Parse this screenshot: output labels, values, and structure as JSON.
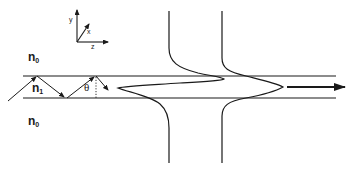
{
  "diagram": {
    "title": "",
    "colors": {
      "line": "#1a1a1a",
      "background": "#ffffff"
    },
    "axes": {
      "y_label": "y",
      "x_label": "x",
      "z_label": "z"
    },
    "regions": {
      "cladding_top": {
        "symbol": "n",
        "subscript": "0"
      },
      "core": {
        "symbol": "n",
        "subscript": "1"
      },
      "cladding_bottom": {
        "symbol": "n",
        "subscript": "0"
      }
    },
    "angle_label": "θ",
    "elements": [
      "waveguide-core-boundaries",
      "zigzag-ray",
      "mode-profile-1",
      "mode-profile-2",
      "propagation-arrow"
    ]
  }
}
